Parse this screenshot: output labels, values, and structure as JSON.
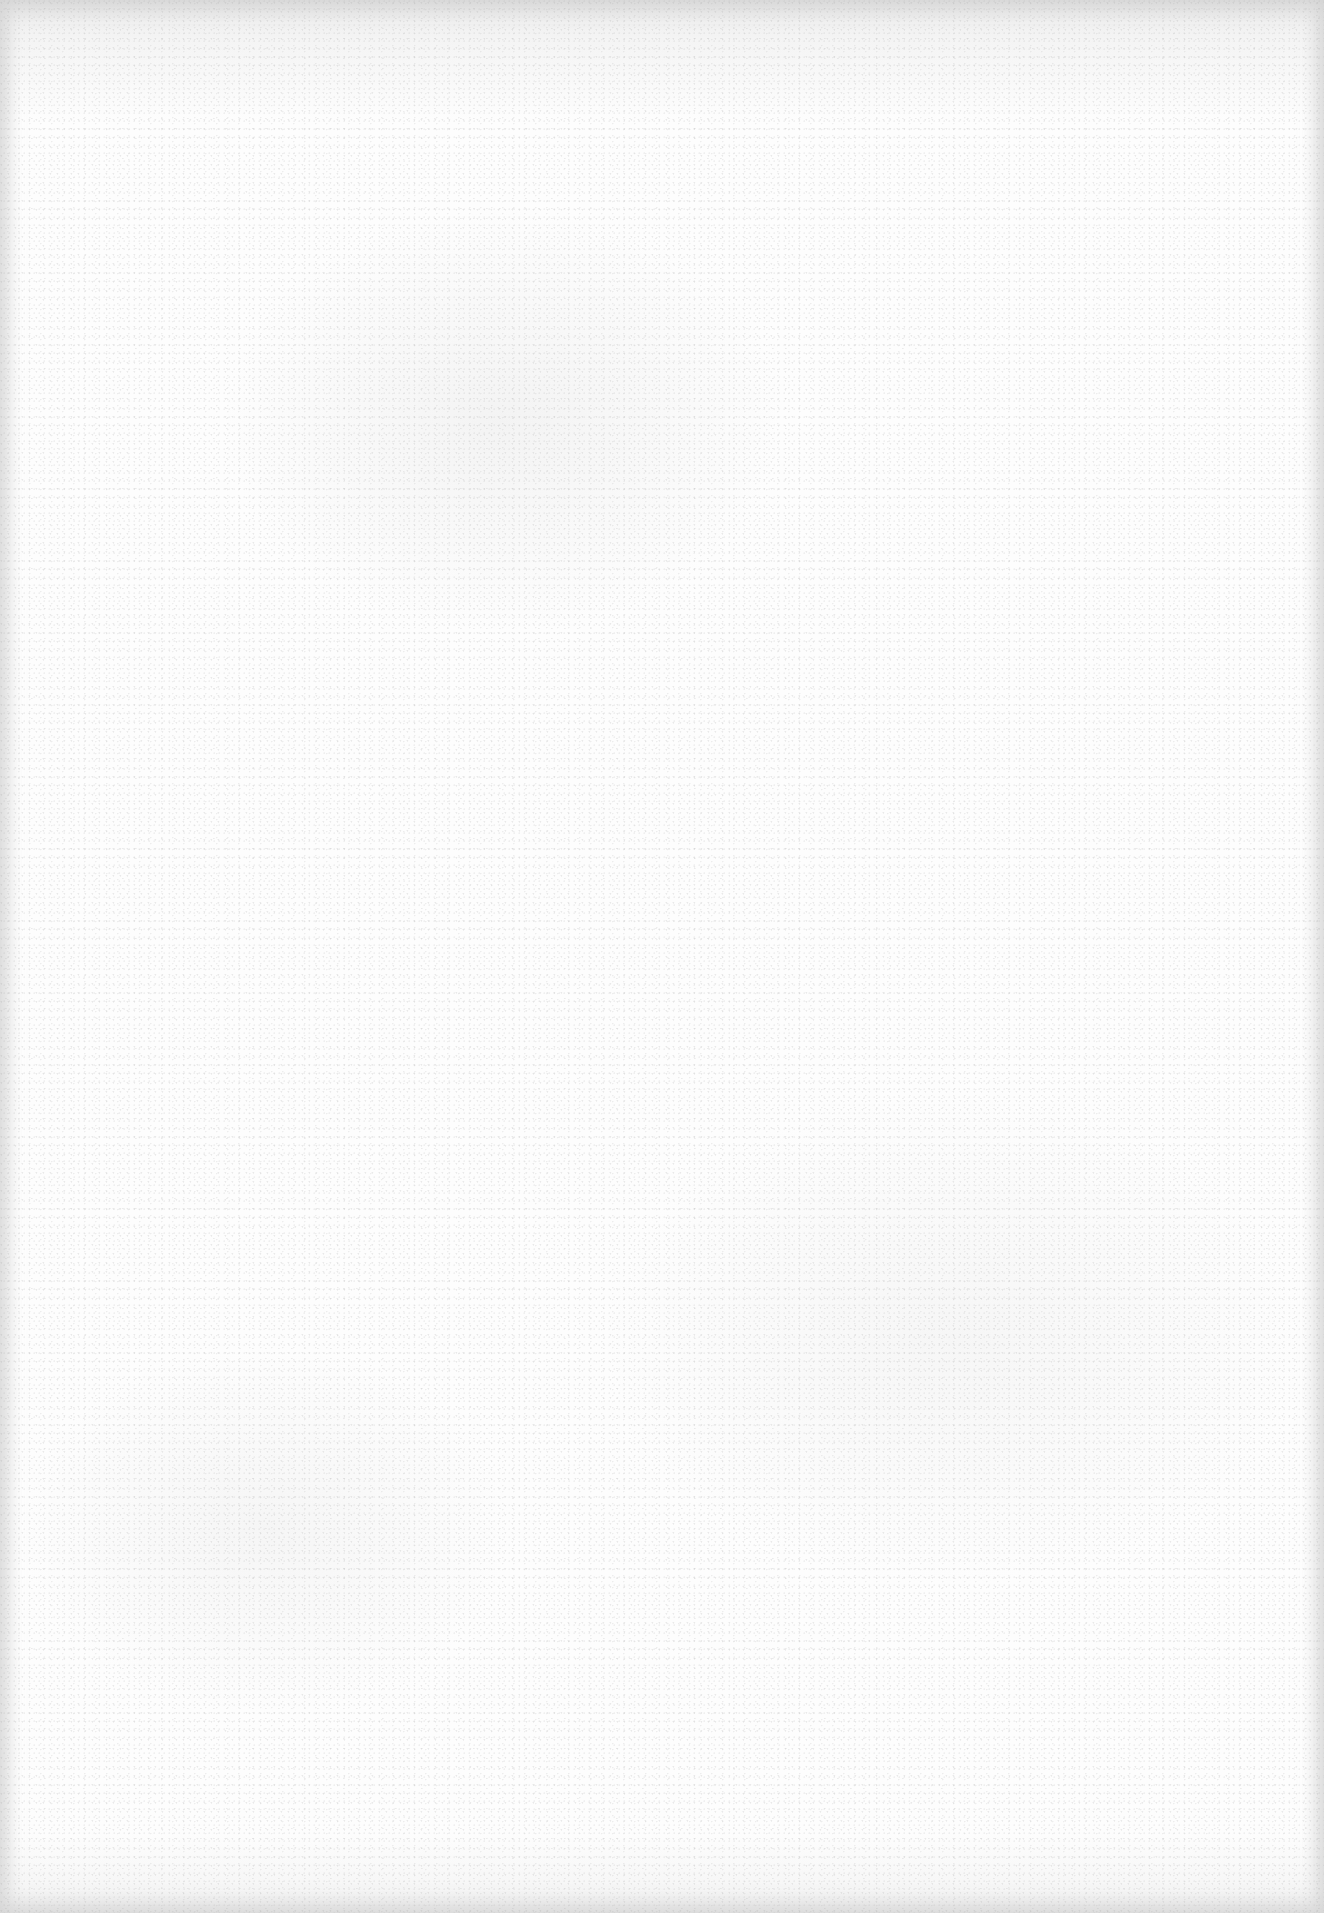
{
  "document": {
    "content": "",
    "is_blank": true
  },
  "colors": {
    "paper": "#fdfdfd",
    "edge": "#e6e6e6",
    "speckle": "#b4b4b4"
  }
}
